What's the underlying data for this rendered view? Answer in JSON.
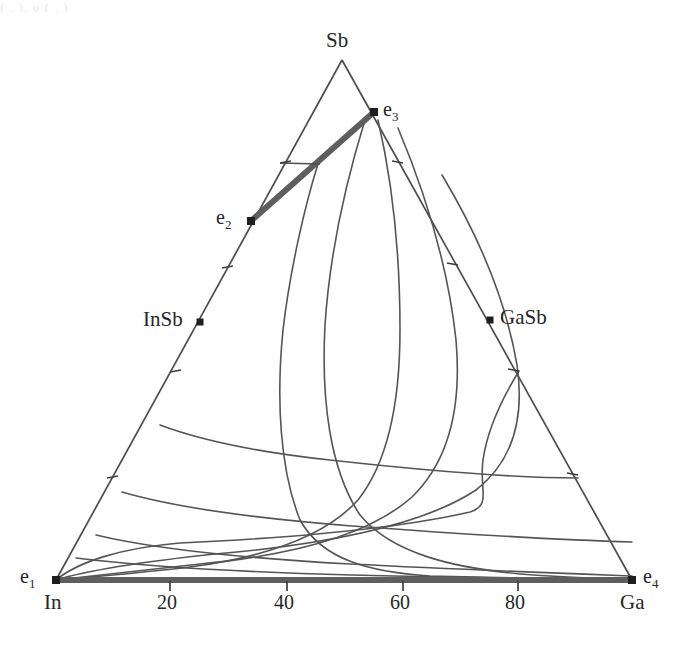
{
  "figure": {
    "type": "ternary-liquidus-phase-diagram",
    "system": "In-Ga-Sb",
    "background": "#ffffff",
    "line_color": "#4d4d4d",
    "bold_line_color": "#595959",
    "text_color": "#262626",
    "ghost_header": "(  , ), g  ( , )"
  },
  "vertices": {
    "top": {
      "label": "Sb",
      "x": 342,
      "y": 60
    },
    "bottom_left": {
      "label": "In",
      "x": 56,
      "y": 580
    },
    "bottom_right": {
      "label": "Ga",
      "x": 632,
      "y": 580
    }
  },
  "axis": {
    "bottom_tick_labels": [
      "20",
      "40",
      "60",
      "80"
    ],
    "bottom_tick_values": [
      20,
      40,
      60,
      80
    ],
    "bottom_tick_x": [
      170,
      287,
      403,
      518
    ],
    "left_edge_ticks_y": [
      268,
      372,
      478
    ],
    "right_edge_ticks_y": [
      163,
      265,
      371,
      475
    ],
    "left_extra_tick": {
      "x": 280,
      "y": 163
    }
  },
  "points": [
    {
      "name": "e1",
      "label": "e",
      "sub": "1",
      "x": 56,
      "y": 580,
      "label_x": 20,
      "label_y": 568
    },
    {
      "name": "e2",
      "label": "e",
      "sub": "2",
      "x": 251,
      "y": 221,
      "label_x": 216,
      "label_y": 209
    },
    {
      "name": "e3",
      "label": "e",
      "sub": "3",
      "x": 374,
      "y": 112,
      "label_x": 383,
      "label_y": 101
    },
    {
      "name": "e4",
      "label": "e",
      "sub": "4",
      "x": 632,
      "y": 580,
      "label_x": 643,
      "label_y": 568
    }
  ],
  "compounds": [
    {
      "name": "InSb",
      "label": "InSb",
      "x": 200,
      "y": 322,
      "label_x": 143,
      "label_y": 310,
      "align": "right"
    },
    {
      "name": "GaSb",
      "label": "GaSb",
      "x": 490,
      "y": 320,
      "label_x": 499,
      "label_y": 308,
      "align": "left"
    }
  ],
  "chart_data": {
    "type": "line",
    "title": "",
    "xlabel": "",
    "ylabel": "",
    "axis_ranges": {
      "x": [
        0,
        100
      ],
      "tick_step": 20
    },
    "grid": false,
    "legend": "none",
    "series": [
      {
        "name": "isotherm-1",
        "path": "M 318,164 C 305,205 290,270 283,330 C 276,400 280,470 300,520 C 322,560 370,572 430,576 C 500,578 580,579 632,580"
      },
      {
        "name": "isotherm-2",
        "path": "M 365,120 C 348,175 330,250 325,325 C 321,400 330,470 360,515 C 392,554 455,568 520,574 C 572,578 612,579 632,580"
      },
      {
        "name": "isotherm-3",
        "path": "M 378,120 C 392,180 400,255 400,330 C 400,402 388,462 358,500 C 322,540 258,558 190,567 C 130,574 80,578 56,580"
      },
      {
        "name": "isotherm-4",
        "path": "M 398,128 C 424,190 448,265 456,340 C 462,408 448,462 412,497 C 366,538 284,556 200,564 C 130,572 80,577 56,580"
      },
      {
        "name": "isotherm-5",
        "path": "M 442,175 C 478,235 506,300 517,365 C 525,420 512,462 476,490 C 420,527 320,545 215,554 C 140,562 82,572 56,580"
      },
      {
        "name": "isotherm-6",
        "path": "M 519,371 C 500,402 487,432 483,460 C 479,490 492,505 470,512 C 392,530 268,539 180,543 C 120,548 78,562 56,580"
      },
      {
        "name": "isotherm-7",
        "path": "M 160,425 C 200,440 256,452 330,460 C 420,470 520,478 578,478"
      },
      {
        "name": "isotherm-8",
        "path": "M 122,492 C 170,506 250,518 352,526 C 460,534 560,540 632,542"
      },
      {
        "name": "isotherm-9",
        "path": "M 96,535 C 150,548 240,558 350,564 C 470,570 580,574 632,576"
      },
      {
        "name": "isotherm-10",
        "path": "M 76,558 C 140,566 240,572 352,575 C 470,578 580,579 632,579"
      }
    ],
    "boundaries": [
      {
        "name": "e2-e3-univariant",
        "from": "e2",
        "to": "e3",
        "style": "bold",
        "width": 6
      },
      {
        "name": "e1-e4-binary-InGa",
        "from": "e1",
        "to": "e4",
        "style": "bold",
        "width": 6
      },
      {
        "name": "InSb-GaSb-join-segment",
        "from": [
          280,
          163
        ],
        "to": [
          318,
          164
        ],
        "style": "thin"
      }
    ]
  }
}
